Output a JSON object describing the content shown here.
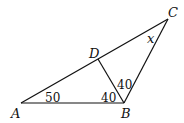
{
  "diagram": {
    "type": "triangle-geometry",
    "points": {
      "A": {
        "label": "A",
        "x": 21,
        "y": 103
      },
      "B": {
        "label": "B",
        "x": 124,
        "y": 103
      },
      "C": {
        "label": "C",
        "x": 168,
        "y": 19
      },
      "D": {
        "label": "D",
        "x": 98,
        "y": 59
      }
    },
    "segments": [
      "AB",
      "BC",
      "AC",
      "DB"
    ],
    "angles": [
      {
        "at": "A",
        "value": "50"
      },
      {
        "at": "B",
        "between": "AB-DB",
        "value": "40"
      },
      {
        "at": "B",
        "between": "DB-BC",
        "value": "40"
      },
      {
        "at": "C",
        "value": "x"
      }
    ]
  }
}
